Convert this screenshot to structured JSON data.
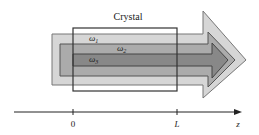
{
  "diagram": {
    "crystal_label": "Crystal",
    "beams": [
      {
        "label": "ω",
        "subscript": "1",
        "color": "#d6d6d6",
        "stroke": "#777777"
      },
      {
        "label": "ω",
        "subscript": "2",
        "color": "#ababab",
        "stroke": "#555555"
      },
      {
        "label": "ω",
        "subscript": "3",
        "color": "#888888",
        "stroke": "#444444"
      }
    ],
    "axis": {
      "ticks": [
        {
          "label": "0"
        },
        {
          "label": "L"
        }
      ],
      "variable": "z"
    }
  }
}
